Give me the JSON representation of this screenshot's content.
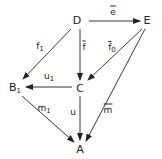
{
  "diagram": {
    "nodes": [
      {
        "id": "D",
        "label": "D",
        "sub": "",
        "x": 77,
        "y": 20
      },
      {
        "id": "E",
        "label": "E",
        "sub": "",
        "x": 147,
        "y": 20
      },
      {
        "id": "B1",
        "label": "B",
        "sub": "1",
        "x": 15,
        "y": 89
      },
      {
        "id": "C",
        "label": "C",
        "sub": "",
        "x": 80,
        "y": 88
      },
      {
        "id": "A",
        "label": "A",
        "sub": "",
        "x": 80,
        "y": 149
      }
    ],
    "edges": [
      {
        "from": "D",
        "to": "E",
        "label": "e",
        "sub": "",
        "bar": true,
        "lx": 113,
        "ly": 12
      },
      {
        "from": "D",
        "to": "B1",
        "label": "f",
        "sub": "1",
        "bar": false,
        "lx": 40,
        "ly": 48
      },
      {
        "from": "D",
        "to": "C",
        "label": "f",
        "sub": "",
        "bar": true,
        "lx": 84,
        "ly": 47
      },
      {
        "from": "E",
        "to": "C",
        "label": "f",
        "sub": "0",
        "bar": true,
        "lx": 112,
        "ly": 49
      },
      {
        "from": "C",
        "to": "B1",
        "label": "u",
        "sub": "1",
        "bar": false,
        "lx": 49,
        "ly": 78
      },
      {
        "from": "C",
        "to": "A",
        "label": "u",
        "sub": "",
        "bar": false,
        "lx": 73,
        "ly": 112
      },
      {
        "from": "E",
        "to": "A",
        "label": "m",
        "sub": "",
        "bar": true,
        "lx": 108,
        "ly": 110
      },
      {
        "from": "B1",
        "to": "A",
        "label": "m",
        "sub": "1",
        "bar": false,
        "lx": 44,
        "ly": 110
      }
    ]
  }
}
